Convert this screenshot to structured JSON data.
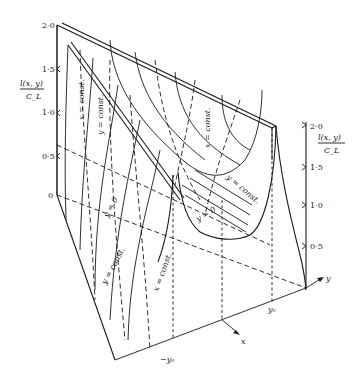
{
  "figure": {
    "type": "3d-surface-diagram",
    "left_axis": {
      "label_numerator": "l(x, y)",
      "label_denominator": "C_L",
      "ticks": [
        "2·0",
        "1·5",
        "1·0",
        "0·5",
        "0"
      ]
    },
    "right_axis": {
      "label_numerator": "l(x, y)",
      "label_denominator": "C_L",
      "ticks": [
        "2·0",
        "1·5",
        "1·0",
        "0·5"
      ]
    },
    "axes": {
      "x_label": "x",
      "y_label": "y",
      "y0_label": "y₀",
      "neg_y0_label": "−y₀"
    },
    "curve_labels": {
      "x_const_1": "x = const.",
      "y_const_1": "y = const.",
      "y_zero_1": "y = 0",
      "x_const_2": "x = const.",
      "y_const_2": "y = const.",
      "y_zero_2": "y = 0",
      "y_const_3": "y = const.",
      "x_const_3": "x = const."
    }
  }
}
